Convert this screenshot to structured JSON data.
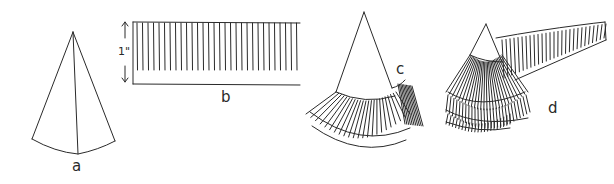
{
  "figure": {
    "panels": [
      {
        "id": "a",
        "label": "a",
        "description": "cone"
      },
      {
        "id": "b",
        "label": "b",
        "description": "fringed strip",
        "dimension": "1\""
      },
      {
        "id": "c",
        "label": "c",
        "description": "cone with first fringe layer"
      },
      {
        "id": "d",
        "label": "d",
        "description": "cone wrapped with multiple fringe layers"
      }
    ],
    "line_color": "#2a2a2a",
    "background": "#ffffff"
  }
}
